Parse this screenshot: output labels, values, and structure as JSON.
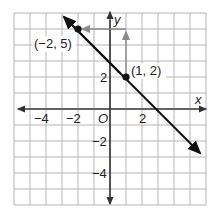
{
  "figure": {
    "type": "coordinate-plane-line",
    "axes": {
      "x_label": "x",
      "y_label": "y",
      "origin_label": "O",
      "x_range": [
        -6,
        6
      ],
      "y_range": [
        -6,
        6
      ],
      "x_tick_labels": [
        "−4",
        "−2",
        "2"
      ],
      "y_tick_labels": [
        "2",
        "−2",
        "−4"
      ]
    },
    "points": [
      {
        "label": "(−2, 5)",
        "x": -2,
        "y": 5
      },
      {
        "label": "(1, 2)",
        "x": 1,
        "y": 2
      }
    ],
    "line": {
      "slope": -1,
      "intercept": 3,
      "equation": "y = -x + 3"
    },
    "slope_triangle": {
      "rise": 3,
      "run": -3,
      "description": "vertical arrow up from (1,2) to (1,5), horizontal arrow left from (1,5) to (-2,5)"
    },
    "colors": {
      "grid": "#b5b5b5",
      "axis": "#333333",
      "line": "#111111",
      "arrow": "#8a8a8a"
    }
  }
}
